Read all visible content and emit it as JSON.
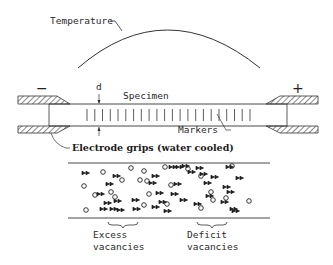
{
  "labels": {
    "temperature": "Temperature",
    "specimen": "Specimen",
    "d": "d",
    "markers": "Markers",
    "electrode_grips": "Electrode grips (water cooled)",
    "minus": "−",
    "plus": "+",
    "excess_line1": "Excess",
    "excess_line2": "vacancies",
    "deficit_line1": "Deficit",
    "deficit_line2": "vacancies"
  },
  "marker_count": 22,
  "particles": {
    "atoms_symbol": "double-arrow",
    "vacancy_symbol": "circle"
  },
  "colors": {
    "line": "#333333",
    "hatch": "#555555"
  }
}
